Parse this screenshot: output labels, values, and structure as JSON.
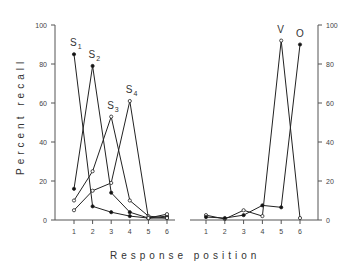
{
  "chart_data": [
    {
      "type": "line",
      "panel": "left",
      "title": "",
      "xlabel": "Response position",
      "ylabel": "Percent recall",
      "x": [
        1,
        2,
        3,
        4,
        5,
        6
      ],
      "xlim": [
        0,
        6.5
      ],
      "ylim": [
        0,
        100
      ],
      "yticks": [
        0,
        20,
        40,
        60,
        80,
        100
      ],
      "grid": false,
      "series": [
        {
          "name": "S1",
          "marker": "filled-circle",
          "values": [
            85,
            7,
            4,
            2,
            1,
            1
          ]
        },
        {
          "name": "S2",
          "marker": "filled-circle",
          "values": [
            16,
            79,
            14,
            4,
            1,
            2
          ]
        },
        {
          "name": "S3",
          "marker": "open-circle",
          "values": [
            10,
            25,
            53,
            10,
            2,
            1
          ]
        },
        {
          "name": "S4",
          "marker": "open-circle",
          "values": [
            5,
            15,
            19,
            61,
            1,
            3
          ]
        }
      ],
      "annotations": [
        {
          "text": "S",
          "sub": "1",
          "x": 1,
          "y": 85
        },
        {
          "text": "S",
          "sub": "2",
          "x": 2,
          "y": 79
        },
        {
          "text": "S",
          "sub": "3",
          "x": 3,
          "y": 53
        },
        {
          "text": "S",
          "sub": "4",
          "x": 4,
          "y": 61
        }
      ]
    },
    {
      "type": "line",
      "panel": "right",
      "title": "",
      "xlabel": "Response position",
      "ylabel": "",
      "yaxis_side": "right",
      "x": [
        1,
        2,
        3,
        4,
        5,
        6
      ],
      "xlim": [
        0,
        6.5
      ],
      "ylim": [
        0,
        100
      ],
      "yticks": [
        0,
        20,
        40,
        60,
        80,
        100
      ],
      "grid": false,
      "series": [
        {
          "name": "V",
          "marker": "open-circle",
          "values": [
            2.5,
            0.5,
            5,
            2,
            92,
            1
          ]
        },
        {
          "name": "O",
          "marker": "filled-circle",
          "values": [
            1.5,
            1,
            2.5,
            7.5,
            6.5,
            90
          ]
        }
      ],
      "annotations": [
        {
          "text": "V",
          "x": 5,
          "y": 92
        },
        {
          "text": "O",
          "x": 6,
          "y": 90
        }
      ]
    }
  ],
  "labels": {
    "ylabel": "Percent recall",
    "xlabel": "Response position",
    "xticks": [
      "1",
      "2",
      "3",
      "4",
      "5",
      "6"
    ],
    "yticks": [
      "0",
      "20",
      "40",
      "60",
      "80",
      "100"
    ]
  }
}
